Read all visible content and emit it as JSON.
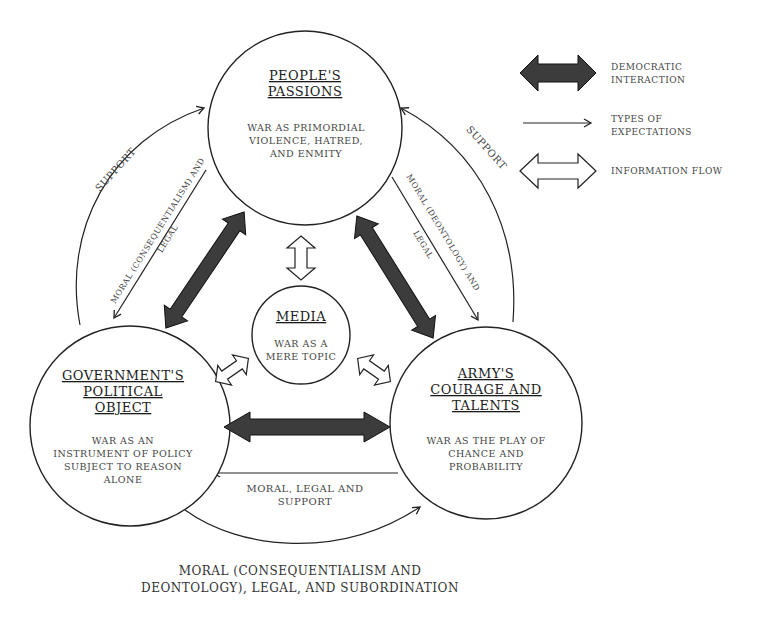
{
  "nodes": {
    "people": {
      "title_line1": "PEOPLE'S",
      "title_line2": "PASSIONS",
      "desc_line1": "WAR AS PRIMORDIAL",
      "desc_line2": "VIOLENCE, HATRED,",
      "desc_line3": "AND ENMITY"
    },
    "government": {
      "title_line1": "GOVERNMENT'S",
      "title_line2": "POLITICAL",
      "title_line3": "OBJECT",
      "desc_line1": "WAR AS AN",
      "desc_line2": "INSTRUMENT OF POLICY",
      "desc_line3": "SUBJECT TO REASON",
      "desc_line4": "ALONE"
    },
    "army": {
      "title_line1": "ARMY'S",
      "title_line2": "COURAGE AND",
      "title_line3": "TALENTS",
      "desc_line1": "WAR AS THE PLAY OF",
      "desc_line2": "CHANCE AND",
      "desc_line3": "PROBABILITY"
    },
    "media": {
      "title": "MEDIA",
      "desc_line1": "WAR AS A",
      "desc_line2": "MERE TOPIC"
    }
  },
  "edges": {
    "left_support": "SUPPORT",
    "right_support": "SUPPORT",
    "left_moral_line1": "MORAL (CONSEQUENTIALISM) AND",
    "left_moral_line2": "LEGAL",
    "right_moral_line1": "MORAL (DEONTOLOGY) AND",
    "right_moral_line2": "LEGAL",
    "army_to_gov_line1": "MORAL, LEGAL AND",
    "army_to_gov_line2": "SUPPORT",
    "bottom_line1": "MORAL (CONSEQUENTIALISM AND",
    "bottom_line2": "DEONTOLOGY), LEGAL, AND SUBORDINATION"
  },
  "legend": {
    "democratic_line1": "DEMOCRATIC",
    "democratic_line2": "INTERACTION",
    "expectations_line1": "TYPES OF",
    "expectations_line2": "EXPECTATIONS",
    "information": "INFORMATION FLOW"
  },
  "colors": {
    "dark_arrow": "#3c3c3c",
    "stroke": "#222222",
    "text": "#444444"
  }
}
